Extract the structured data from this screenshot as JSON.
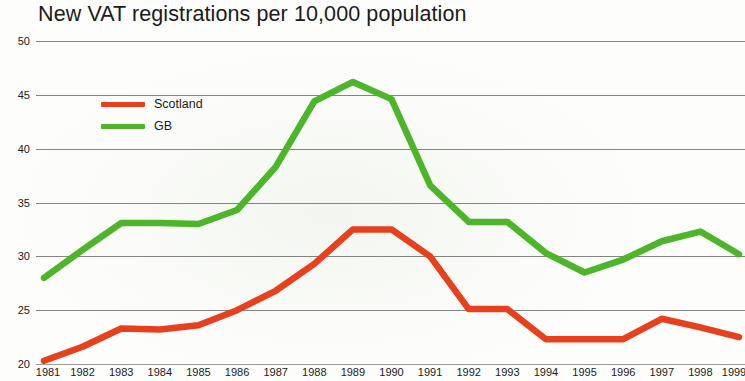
{
  "title": "New VAT registrations per 10,000 population",
  "legend": {
    "items": [
      {
        "label": "Scotland",
        "color": "#e8401c"
      },
      {
        "label": "GB",
        "color": "#4cb529"
      }
    ]
  },
  "axes": {
    "y_ticks": [
      "50",
      "45",
      "40",
      "35",
      "30",
      "25",
      "20"
    ],
    "x_ticks": [
      "1981",
      "1982",
      "1983",
      "1984",
      "1985",
      "1986",
      "1987",
      "1988",
      "1989",
      "1990",
      "1991",
      "1992",
      "1993",
      "1994",
      "1995",
      "1996",
      "1997",
      "1998",
      "1999"
    ]
  },
  "chart_data": {
    "type": "line",
    "title": "New VAT registrations per 10,000 population",
    "xlabel": "",
    "ylabel": "",
    "ylim": [
      20,
      50
    ],
    "ytick_step": 5,
    "grid": true,
    "legend_position": "inside-upper-left",
    "x": [
      1981,
      1982,
      1983,
      1984,
      1985,
      1986,
      1987,
      1988,
      1989,
      1990,
      1991,
      1992,
      1993,
      1994,
      1995,
      1996,
      1997,
      1998,
      1999
    ],
    "series": [
      {
        "name": "GB",
        "color": "#4cb529",
        "values": [
          28.0,
          30.6,
          33.1,
          33.1,
          33.0,
          34.3,
          38.3,
          44.4,
          46.2,
          44.6,
          36.6,
          33.2,
          33.2,
          30.3,
          28.5,
          29.7,
          31.4,
          32.3,
          30.2
        ]
      },
      {
        "name": "Scotland",
        "color": "#e8401c",
        "values": [
          20.3,
          21.6,
          23.3,
          23.2,
          23.6,
          25.0,
          26.8,
          29.3,
          32.5,
          32.5,
          30.0,
          25.1,
          25.1,
          22.3,
          22.3,
          22.3,
          24.2,
          23.4,
          22.5
        ]
      }
    ]
  }
}
